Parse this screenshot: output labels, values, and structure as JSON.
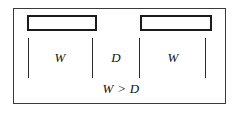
{
  "diagram": {
    "frame": {
      "border_color": "#3a3a3a",
      "background": "#ffffff"
    },
    "bars": [
      {
        "id": "left-bar",
        "label": "W",
        "outline_color": "#1a1a1a"
      },
      {
        "id": "right-bar",
        "label": "W",
        "outline_color": "#1a1a1a"
      }
    ],
    "ticks": [
      {
        "id": "tick-1"
      },
      {
        "id": "tick-2"
      },
      {
        "id": "tick-3"
      },
      {
        "id": "tick-4"
      }
    ],
    "dimension_labels": [
      {
        "id": "left-width",
        "text": "W"
      },
      {
        "id": "gap-distance",
        "text": "D"
      },
      {
        "id": "right-width",
        "text": "W"
      }
    ],
    "caption": {
      "text": "W > D",
      "left_symbol": "W",
      "relation": ">",
      "right_symbol": "D"
    }
  }
}
